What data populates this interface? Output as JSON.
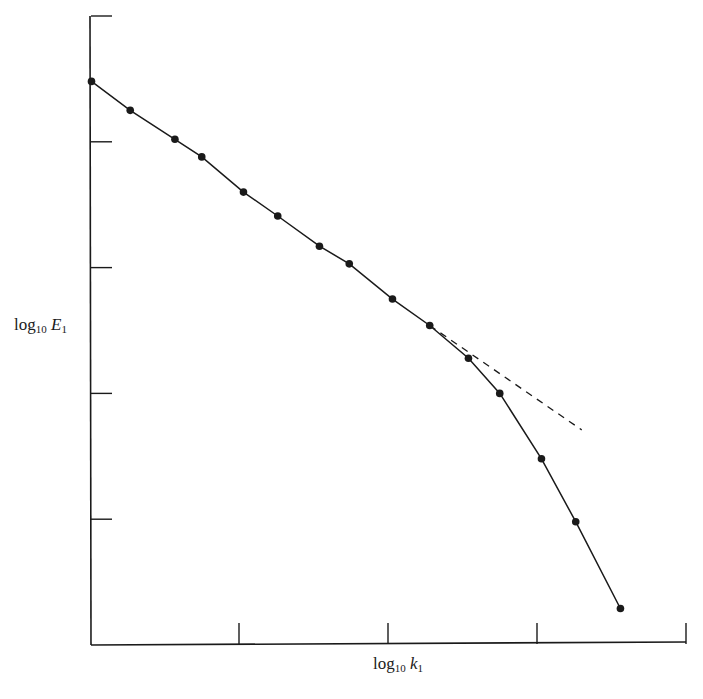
{
  "chart_data": {
    "type": "line",
    "title": "",
    "xlabel": "log10 k1",
    "ylabel": "log10 E1",
    "xlabel_parts": {
      "prefix": "log",
      "sub": "10",
      "var": "k",
      "var_sub": "1"
    },
    "ylabel_parts": {
      "prefix": "log",
      "sub": "10",
      "var": "E",
      "var_sub": "1"
    },
    "xlim": [
      0,
      4
    ],
    "ylim": [
      0,
      5
    ],
    "x_ticks": [
      1,
      2,
      3,
      4
    ],
    "y_ticks": [
      1,
      2,
      3,
      4,
      5
    ],
    "tick_labels_shown": false,
    "grid": false,
    "legend": null,
    "series": [
      {
        "name": "measured spectrum",
        "style": "solid line with filled circle markers",
        "color": "#1a1a1a",
        "x": [
          0.01,
          0.27,
          0.57,
          0.75,
          1.03,
          1.26,
          1.54,
          1.74,
          2.03,
          2.28,
          2.54,
          2.75,
          3.03,
          3.26,
          3.56
        ],
        "y": [
          4.48,
          4.25,
          4.02,
          3.88,
          3.6,
          3.41,
          3.17,
          3.03,
          2.75,
          2.54,
          2.28,
          2.0,
          1.48,
          0.98,
          0.29
        ]
      },
      {
        "name": "power-law extrapolation",
        "style": "dashed line",
        "color": "#1a1a1a",
        "x": [
          2.28,
          3.3
        ],
        "y": [
          2.54,
          1.71
        ]
      }
    ]
  }
}
